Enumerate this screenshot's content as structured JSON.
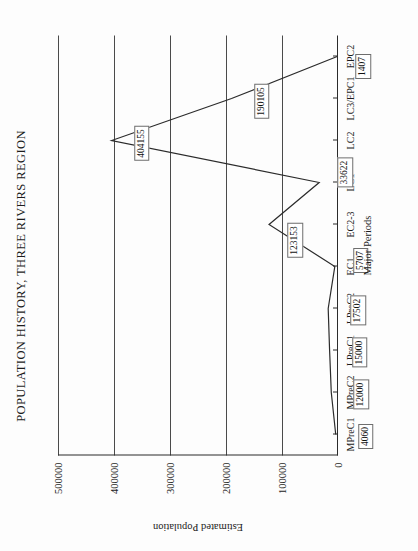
{
  "chart_data": {
    "type": "line",
    "title": "POPULATION HISTORY, THREE RIVERS REGION",
    "xlabel": "Major Periods",
    "ylabel": "Estimated Population",
    "grid": true,
    "legend": "none",
    "orientation": "rotated-90-ccw",
    "categories": [
      "MPreC1",
      "MPreC2",
      "LPreC1",
      "LPreC2",
      "EC1",
      "EC2-3",
      "LC1",
      "LC2",
      "LC3/EPC1",
      "EPC2"
    ],
    "values": [
      4060,
      12000,
      15000,
      17502,
      5707,
      123153,
      33622,
      404155,
      190105,
      1407
    ],
    "point_labels": [
      "4060",
      "12000",
      "15000",
      "17502",
      "5707",
      "123153",
      "33622",
      "404155",
      "190105",
      "1407"
    ],
    "ylim": [
      0,
      500000
    ],
    "yticks": [
      0,
      100000,
      200000,
      300000,
      400000,
      500000
    ],
    "ytick_labels": [
      "0",
      "100000",
      "200000",
      "300000",
      "400000",
      "500000"
    ],
    "xlim_categories": 10
  },
  "axis": {
    "y_title": "Estimated Population",
    "x_title": "Major Periods"
  },
  "colors": {
    "line": "#2b2b2b",
    "grid": "#4a4a4a",
    "axis": "#2b2b2b",
    "text": "#1c1c1c",
    "box_border": "#6e6e6e",
    "background": "#fdfdfd"
  }
}
